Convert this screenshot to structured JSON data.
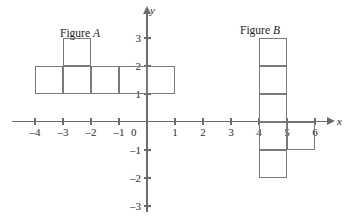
{
  "figure": {
    "title_a": "Figure ",
    "title_a_italic": "A",
    "title_b": "Figure ",
    "title_b_italic": "B"
  },
  "axes": {
    "x_name": "x",
    "y_name": "y",
    "origin_label": "0",
    "x_tick_labels": [
      "–4",
      "–3",
      "–2",
      "–1",
      "1",
      "2",
      "3",
      "4",
      "5",
      "6"
    ],
    "y_tick_labels": [
      "3",
      "2",
      "1",
      "–1",
      "–2",
      "–3"
    ]
  },
  "chart_data": {
    "type": "diagram",
    "xlabel": "x",
    "ylabel": "y",
    "xlim": [
      -4.8,
      6.4
    ],
    "ylim": [
      -3.6,
      3.6
    ],
    "grid": false,
    "legend": null,
    "origin_px": {
      "x": 147,
      "y": 122
    },
    "unit_px": 28,
    "x_ticks": [
      -4,
      -3,
      -2,
      -1,
      0,
      1,
      2,
      3,
      4,
      5,
      6
    ],
    "y_ticks": [
      3,
      2,
      1,
      0,
      -1,
      -2,
      -3
    ],
    "shapes": [
      {
        "name": "Figure A",
        "label": "Figure A",
        "description": "Horizontal row of five unit squares from x=-4 to x=1 at y=1..2, with one extra unit square on top at x=-3..-2, y=2..3",
        "cells": [
          {
            "x0": -4,
            "y0": 1,
            "x1": -3,
            "y1": 2
          },
          {
            "x0": -3,
            "y0": 1,
            "x1": -2,
            "y1": 2
          },
          {
            "x0": -2,
            "y0": 1,
            "x1": -1,
            "y1": 2
          },
          {
            "x0": -1,
            "y0": 1,
            "x1": 0,
            "y1": 2
          },
          {
            "x0": 0,
            "y0": 1,
            "x1": 1,
            "y1": 2
          },
          {
            "x0": -3,
            "y0": 2,
            "x1": -2,
            "y1": 3
          }
        ],
        "cell_count": 6
      },
      {
        "name": "Figure B",
        "label": "Figure B",
        "description": "Vertical column of five unit squares from y=-2 to y=3 at x=4..5, with one extra unit square to the right at x=5..6, y=-1..0",
        "cells": [
          {
            "x0": 4,
            "y0": 2,
            "x1": 5,
            "y1": 3
          },
          {
            "x0": 4,
            "y0": 1,
            "x1": 5,
            "y1": 2
          },
          {
            "x0": 4,
            "y0": 0,
            "x1": 5,
            "y1": 1
          },
          {
            "x0": 4,
            "y0": -1,
            "x1": 5,
            "y1": 0
          },
          {
            "x0": 4,
            "y0": -2,
            "x1": 5,
            "y1": -1
          },
          {
            "x0": 5,
            "y0": -1,
            "x1": 6,
            "y1": 0
          }
        ],
        "cell_count": 6
      }
    ]
  },
  "colors": {
    "axis": "#6b6b6b",
    "shape_stroke": "#7a7a7a",
    "text": "#2b2b2b",
    "background": "#ffffff"
  }
}
